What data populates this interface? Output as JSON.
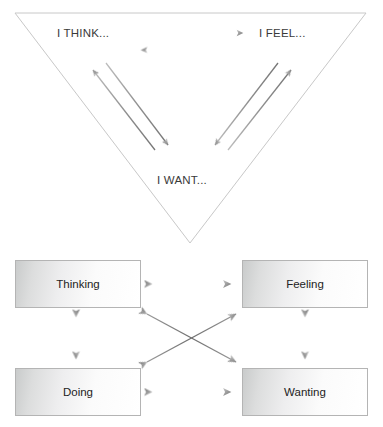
{
  "figure": {
    "title": "",
    "background_color": "#ffffff",
    "accent_color": "#808285",
    "outline_color": "#bfbfbf",
    "text_color": "#2b2b2b"
  },
  "triangle_diagram": {
    "name": "inverted-triangle-diagram",
    "shape": "inverted triangle outline",
    "outline_color": "#c6c6c6",
    "nodes": [
      {
        "id": "think",
        "label": "I THINK...",
        "position": "top-left"
      },
      {
        "id": "feel",
        "label": "I FEEL...",
        "position": "top-right"
      },
      {
        "id": "want",
        "label": "I WANT...",
        "position": "bottom-center"
      }
    ],
    "arrows": [
      {
        "id": "think-to-feel",
        "from": "think",
        "to": "feel",
        "heads": 1,
        "direction": "right"
      },
      {
        "id": "feel-to-think",
        "from": "feel",
        "to": "think",
        "heads": 1,
        "direction": "left"
      },
      {
        "id": "think-to-want",
        "from": "think",
        "to": "want",
        "heads": 1,
        "direction": "down-right"
      },
      {
        "id": "want-to-think",
        "from": "want",
        "to": "think",
        "heads": 1,
        "direction": "up-left"
      },
      {
        "id": "feel-to-want",
        "from": "feel",
        "to": "want",
        "heads": 1,
        "direction": "down-left"
      },
      {
        "id": "want-to-feel",
        "from": "want",
        "to": "feel",
        "heads": 1,
        "direction": "up-right"
      }
    ]
  },
  "box_diagram": {
    "name": "four-box-diagram",
    "box_border_color": "#b4b4b4",
    "boxes": [
      {
        "id": "thinking",
        "label": "Thinking",
        "position": "top-left"
      },
      {
        "id": "feeling",
        "label": "Feeling",
        "position": "top-right"
      },
      {
        "id": "doing",
        "label": "Doing",
        "position": "bottom-left"
      },
      {
        "id": "wanting",
        "label": "Wanting",
        "position": "bottom-right"
      }
    ],
    "arrows": [
      {
        "id": "thinking-feeling",
        "from": "thinking",
        "to": "feeling",
        "heads": 2,
        "orientation": "horizontal"
      },
      {
        "id": "doing-wanting",
        "from": "doing",
        "to": "wanting",
        "heads": 2,
        "orientation": "horizontal"
      },
      {
        "id": "thinking-doing",
        "from": "thinking",
        "to": "doing",
        "heads": 2,
        "orientation": "vertical"
      },
      {
        "id": "feeling-wanting",
        "from": "feeling",
        "to": "wanting",
        "heads": 2,
        "orientation": "vertical"
      },
      {
        "id": "thinking-wanting",
        "from": "thinking",
        "to": "wanting",
        "heads": 2,
        "orientation": "diagonal"
      },
      {
        "id": "doing-feeling",
        "from": "doing",
        "to": "feeling",
        "heads": 2,
        "orientation": "diagonal"
      }
    ]
  }
}
